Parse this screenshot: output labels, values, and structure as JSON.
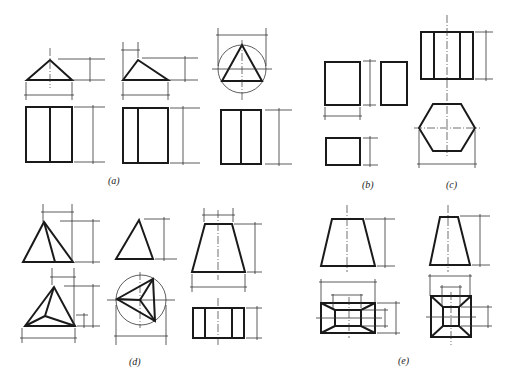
{
  "figure": {
    "type": "orthographic-projection-exercises",
    "panels": [
      {
        "id": "a",
        "label": "(a)",
        "description": "Three triangular prisms: front triangle views with rectangular top views split by a line; third view shows triangle inscribed in circle"
      },
      {
        "id": "b",
        "label": "(b)",
        "description": "Rectangular block: three rectangular views"
      },
      {
        "id": "c",
        "label": "(c)",
        "description": "Hexagonal prism: rectangle with three vertical divisions over hexagon"
      },
      {
        "id": "d",
        "label": "(d)",
        "description": "Triangular pyramids and frustum: triangles, triangle in circle, trapezoid over rectangle with divisions"
      },
      {
        "id": "e",
        "label": "(e)",
        "description": "Square/rectangular frustums: trapezoids over rectangles with inner rectangles and diagonal edges"
      }
    ]
  },
  "labels": {
    "a": "(a)",
    "b": "(b)",
    "c": "(c)",
    "d": "(d)",
    "e": "(e)"
  }
}
